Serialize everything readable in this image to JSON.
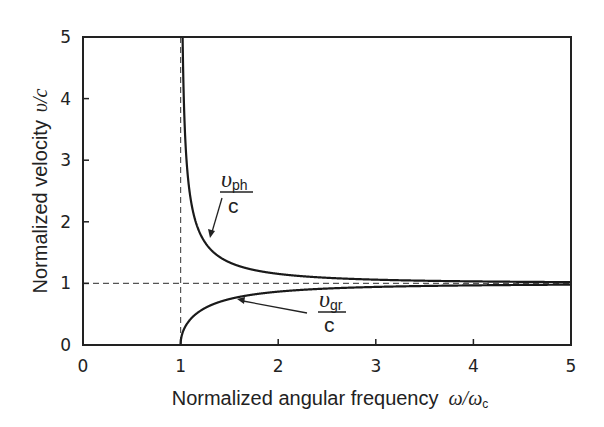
{
  "chart_data": {
    "type": "line",
    "title": "",
    "xlabel": "Normalized angular frequency",
    "xlabel_math": "ω/ω",
    "xlabel_math_sub": "c",
    "ylabel": "Normalized velocity",
    "ylabel_math": "υ/c",
    "xlim": [
      0,
      5
    ],
    "ylim": [
      0,
      5
    ],
    "xticks": [
      "0",
      "1",
      "2",
      "3",
      "4",
      "5"
    ],
    "yticks": [
      "0",
      "1",
      "2",
      "3",
      "4",
      "5"
    ],
    "grid": false,
    "legend": "none (inline annotations)",
    "reference_lines": [
      {
        "orientation": "horizontal",
        "value": 1,
        "style": "dashed"
      },
      {
        "orientation": "vertical",
        "value": 1,
        "style": "dashed"
      }
    ],
    "series": [
      {
        "name": "v_ph/c",
        "label_main": "υ",
        "label_sub": "ph",
        "label_den": "c",
        "formula": "1/sqrt(1-(1/ω)^2)",
        "x": [
          1.02,
          1.05,
          1.1,
          1.2,
          1.3,
          1.5,
          2.0,
          2.5,
          3.0,
          4.0,
          5.0
        ],
        "values": [
          5.03,
          3.28,
          2.4,
          1.81,
          1.56,
          1.34,
          1.15,
          1.09,
          1.06,
          1.03,
          1.02
        ]
      },
      {
        "name": "v_gr/c",
        "label_main": "υ",
        "label_sub": "gr",
        "label_den": "c",
        "formula": "sqrt(1-(1/ω)^2)",
        "x": [
          1.0,
          1.05,
          1.1,
          1.2,
          1.3,
          1.5,
          2.0,
          2.5,
          3.0,
          4.0,
          5.0
        ],
        "values": [
          0.0,
          0.3,
          0.42,
          0.55,
          0.64,
          0.75,
          0.87,
          0.92,
          0.94,
          0.97,
          0.98
        ]
      }
    ],
    "annotations": [
      {
        "text": "υ_ph / c",
        "arrow_to": [
          1.29,
          1.72
        ]
      },
      {
        "text": "υ_gr / c",
        "arrow_to": [
          1.97,
          0.93
        ]
      }
    ]
  }
}
